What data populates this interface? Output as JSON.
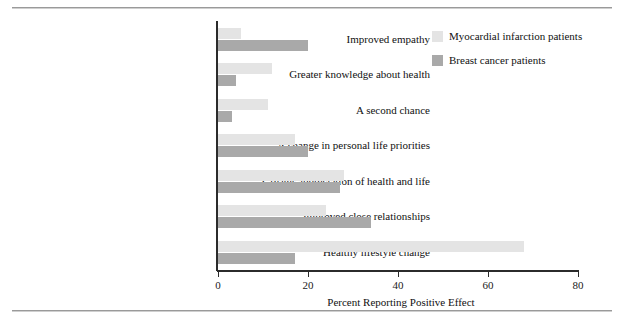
{
  "chart_data": {
    "type": "bar",
    "orientation": "horizontal",
    "title": "",
    "xlabel": "Percent Reporting Positive Effect",
    "ylabel": "",
    "xlim": [
      0,
      80
    ],
    "xticks": [
      0,
      20,
      40,
      60,
      80
    ],
    "grid": false,
    "legend_position": "top-right",
    "categories": [
      "Improved empathy",
      "Greater knowledge about health",
      "A second chance",
      "A change in personal life priorities",
      "Greater appreciation of health and life",
      "Improved close relationships",
      "Healthy lifestyle change"
    ],
    "series": [
      {
        "name": "Myocardial infarction patients",
        "color": "#e4e4e4",
        "values": [
          5,
          12,
          11,
          17,
          28,
          24,
          68
        ]
      },
      {
        "name": "Breast cancer patients",
        "color": "#a9a9a9",
        "values": [
          20,
          4,
          3,
          20,
          27,
          34,
          17
        ]
      }
    ]
  },
  "axis": {
    "tick_labels": [
      "0",
      "20",
      "40",
      "60",
      "80"
    ],
    "x_title": "Percent Reporting Positive Effect"
  },
  "legend": {
    "items": [
      {
        "label": "Myocardial infarction patients",
        "color": "#e4e4e4"
      },
      {
        "label": "Breast cancer patients",
        "color": "#a9a9a9"
      }
    ]
  }
}
